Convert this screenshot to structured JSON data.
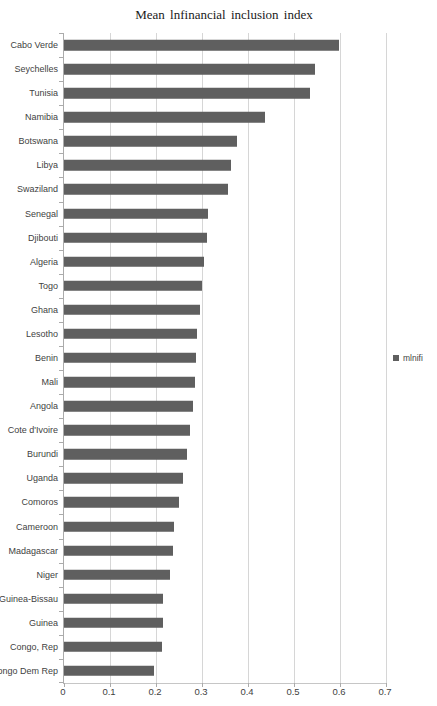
{
  "chart_data": {
    "type": "bar",
    "orientation": "horizontal",
    "title": "Mean lnfinancial inclusion index",
    "legend_label": "mlnifi",
    "legend_position": "right",
    "categories": [
      "Cabo Verde",
      "Seychelles",
      "Tunisia",
      "Namibia",
      "Botswana",
      "Libya",
      "Swaziland",
      "Senegal",
      "Djibouti",
      "Algeria",
      "Togo",
      "Ghana",
      "Lesotho",
      "Benin",
      "Mali",
      "Angola",
      "Cote d'Ivoire",
      "Burundi",
      "Uganda",
      "Comoros",
      "Cameroon",
      "Madagascar",
      "Niger",
      "Guinea-Bissau",
      "Guinea",
      "Congo, Rep",
      "Congo Dem Rep"
    ],
    "values": [
      0.597,
      0.545,
      0.535,
      0.437,
      0.376,
      0.363,
      0.357,
      0.314,
      0.31,
      0.304,
      0.301,
      0.296,
      0.289,
      0.287,
      0.285,
      0.281,
      0.274,
      0.268,
      0.258,
      0.251,
      0.239,
      0.236,
      0.231,
      0.216,
      0.215,
      0.212,
      0.195
    ],
    "xlim": [
      0,
      0.7
    ],
    "x_ticks": [
      "0",
      "0.1",
      "0.2",
      "0.3",
      "0.4",
      "0.5",
      "0.6",
      "0.7"
    ],
    "grid": true,
    "xlabel": "",
    "ylabel": "",
    "colors": {
      "bar": "#5f5f5f",
      "gridline": "#d6d6d6",
      "axis": "#ababab",
      "text": "#3f3f3f",
      "background": "#ffffff"
    }
  }
}
